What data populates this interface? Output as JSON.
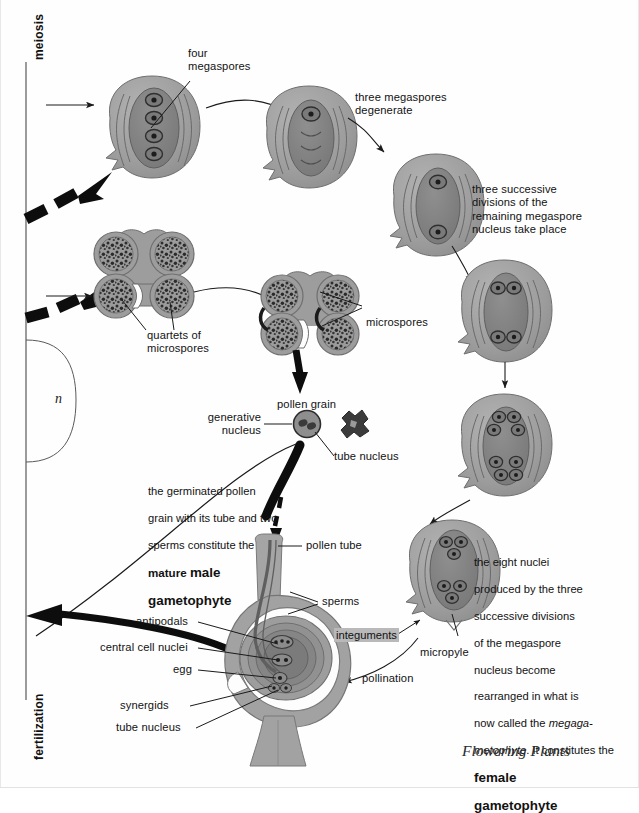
{
  "page": {
    "caption": "Flowering Plants",
    "ploidy_label": "n"
  },
  "axis": {
    "top_label": "meiosis",
    "bottom_label": "fertilization"
  },
  "labels": {
    "four_megaspores": "four\nmegaspores",
    "three_degenerate": "three megaspores\ndegenerate",
    "three_successive": "three successive\ndivisions of the\nremaining megaspore\nnucleus take place",
    "quartets": "quartets of\nmicrospores",
    "microspores": "microspores",
    "pollen_grain": "pollen grain",
    "generative_nucleus": "generative\nnucleus",
    "tube_nucleus_top": "tube nucleus",
    "pollen_tube": "pollen tube",
    "sperms": "sperms",
    "antipodals": "antipodals",
    "central_cell_nuclei": "central cell nuclei",
    "egg": "egg",
    "synergids": "synergids",
    "tube_nucleus_bottom": "tube nucleus",
    "integuments": "integuments",
    "micropyle": "micropyle",
    "pollination": "pollination"
  },
  "paragraphs": {
    "male_gametophyte": {
      "line1": "the germinated pollen",
      "line2": "grain with its tube and two",
      "line3": "sperms constitute the",
      "line4_plain": "mature ",
      "line4_bold": "male",
      "line5_bold": "gametophyte"
    },
    "female_gametophyte": {
      "line1": "the eight nuclei",
      "line2": "produced by the three",
      "line3": "successive divisions",
      "line4": "of the megaspore",
      "line5": "nucleus become",
      "line6": "rearranged in what is",
      "line7_plain": "now called the ",
      "line7_ital": "megaga-",
      "line8_ital": "metophyte",
      "line8_plain": ". It constitutes the",
      "line9_bold": "female",
      "line10_bold": "gametophyte"
    }
  },
  "stages": {
    "megaspore_four": {
      "name": "ovule-four-megaspores",
      "nuclei": 4
    },
    "megaspore_one": {
      "name": "ovule-one-megaspore",
      "nuclei": 1
    },
    "megaspore_two": {
      "name": "ovule-two-nuclei",
      "nuclei": 2
    },
    "megaspore_four_nuc": {
      "name": "ovule-four-nuclei",
      "nuclei": 4
    },
    "megaspore_eight": {
      "name": "ovule-eight-nuclei",
      "nuclei": 8
    },
    "mature_sac": {
      "name": "ovule-mature-embryo-sac",
      "nuclei": 8
    },
    "anther_quartets": {
      "name": "anther-quartets",
      "sacs": 4
    },
    "anther_microspores": {
      "name": "anther-microspores",
      "sacs": 4
    }
  },
  "colors": {
    "ink": "#121212",
    "ovule_fill": "#9d9d9d",
    "ovule_mid": "#8a8a8a",
    "sac_fill": "#7e7e7e",
    "nucleus_fill": "#3a3a3a",
    "outline": "#4a4a4a",
    "highlight": "#b9b9b9",
    "paper": "#fefefe"
  }
}
